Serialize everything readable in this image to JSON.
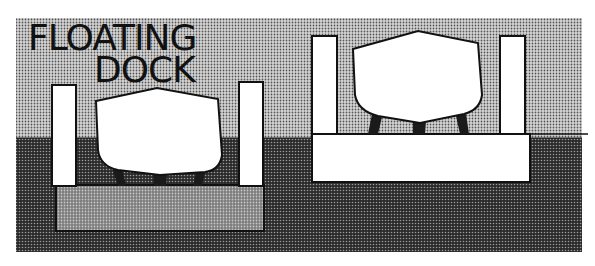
{
  "title": {
    "line1": "FLOATING",
    "line2": "DOCK"
  },
  "panels": [
    {
      "name": "dock-submerged",
      "state": "submerged, ship floating in"
    },
    {
      "name": "dock-raised",
      "state": "raised, ship lifted out of water"
    }
  ],
  "colors": {
    "sky_halftone": "#b8b8b8",
    "water_halftone": "#4a4a4a",
    "dock_submerged_halftone": "#8a8a8a",
    "structure": "#ffffff",
    "outline": "#111111",
    "blocks": "#1a1a1a"
  }
}
